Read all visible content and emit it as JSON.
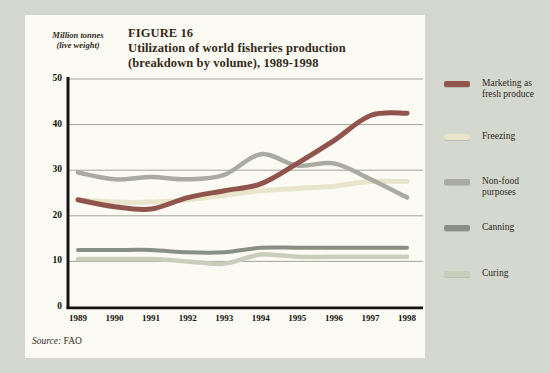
{
  "figure": {
    "unit_label_line1": "Million tonnes",
    "unit_label_line2": "(live weight)",
    "figure_number": "FIGURE 16",
    "title_line1": "Utilization of world fisheries production",
    "title_line2": "(breakdown by volume), 1989-1998",
    "source_prefix": "Source:",
    "source_value": "FAO"
  },
  "legend": {
    "position": "right",
    "items": [
      {
        "label": "Marketing as fresh produce",
        "lines": [
          "Marketing as",
          "fresh produce"
        ],
        "color": "#90544c"
      },
      {
        "label": "Freezing",
        "lines": [
          "Freezing"
        ],
        "color": "#e9e5cc"
      },
      {
        "label": "Non-food purposes",
        "lines": [
          "Non-food",
          "purposes"
        ],
        "color": "#a9aaa0"
      },
      {
        "label": "Canning",
        "lines": [
          "Canning"
        ],
        "color": "#898f83"
      },
      {
        "label": "Curing",
        "lines": [
          "Curing"
        ],
        "color": "#c9cdbb"
      }
    ]
  },
  "chart_data": {
    "type": "line",
    "title": "Utilization of world fisheries production (breakdown by volume), 1989-1998",
    "xlabel": "",
    "ylabel": "Million tonnes (live weight)",
    "x": [
      1989,
      1990,
      1991,
      1992,
      1993,
      1994,
      1995,
      1996,
      1997,
      1998
    ],
    "ylim": [
      0,
      50
    ],
    "yticks": [
      0,
      10,
      20,
      30,
      40,
      50
    ],
    "grid": true,
    "legend_position": "right",
    "series": [
      {
        "name": "Marketing as fresh produce",
        "color": "#90544c",
        "values": [
          23.5,
          22,
          21.5,
          24,
          25.5,
          27,
          31.5,
          36.5,
          42,
          42.5
        ]
      },
      {
        "name": "Freezing",
        "color": "#e9e5cc",
        "values": [
          23.5,
          23,
          23,
          23.5,
          24.5,
          25.5,
          26,
          26.5,
          27.5,
          27.5
        ]
      },
      {
        "name": "Non-food purposes",
        "color": "#a9aaa0",
        "values": [
          29.5,
          28,
          28.5,
          28,
          29,
          33.5,
          31,
          31.5,
          28,
          24
        ]
      },
      {
        "name": "Canning",
        "color": "#898f83",
        "values": [
          12.5,
          12.5,
          12.5,
          12,
          12,
          13,
          13,
          13,
          13,
          13
        ]
      },
      {
        "name": "Curing",
        "color": "#c9cdbb",
        "values": [
          10.5,
          10.5,
          10.5,
          10,
          9.5,
          11.5,
          11,
          11,
          11,
          11
        ]
      }
    ]
  },
  "colors": {
    "page_background": "#d5d8cf",
    "panel_background": "#fbfbf3",
    "gridline": "#98988f",
    "axis": "#141414",
    "title_text": "#33291b"
  }
}
